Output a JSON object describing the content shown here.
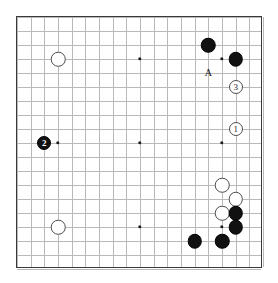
{
  "diagram": {
    "type": "go-board-diagram",
    "board_size": 19,
    "visible_region": {
      "columns": 19,
      "rows": 19,
      "note": "full board frame shown"
    },
    "colors": {
      "black_stone": "#111111",
      "white_stone": "#ffffff",
      "stone_outline": "#4d4d4d",
      "grid_line": "#b9b9b9",
      "border": "#3a3a3a",
      "background": "#ffffff",
      "label_text": "#111111"
    },
    "geometry": {
      "origin_x": 16,
      "origin_y": 16,
      "spacing_x": 13.67,
      "spacing_y": 14.0,
      "stone_diameter": 14.5,
      "numbered_stone_diameter": 14.0,
      "star_diameter": 3.4
    },
    "star_points": [
      {
        "col": 3,
        "row": 3
      },
      {
        "col": 9,
        "row": 3
      },
      {
        "col": 15,
        "row": 3
      },
      {
        "col": 3,
        "row": 9
      },
      {
        "col": 9,
        "row": 9
      },
      {
        "col": 15,
        "row": 9
      },
      {
        "col": 3,
        "row": 15
      },
      {
        "col": 9,
        "row": 15
      },
      {
        "col": 15,
        "row": 15
      }
    ],
    "stones": [
      {
        "id": "white-upper-left-hoshi",
        "color": "white",
        "col": 3,
        "row": 3,
        "label": ""
      },
      {
        "id": "black-upper-right-a",
        "color": "black",
        "col": 14,
        "row": 2,
        "label": ""
      },
      {
        "id": "black-upper-right-b",
        "color": "black",
        "col": 16,
        "row": 3,
        "label": ""
      },
      {
        "id": "white-move-3",
        "color": "white",
        "col": 16,
        "row": 5,
        "label": "3"
      },
      {
        "id": "white-move-1",
        "color": "white",
        "col": 16,
        "row": 8,
        "label": "1"
      },
      {
        "id": "black-move-2",
        "color": "black",
        "col": 2,
        "row": 9,
        "label": "2"
      },
      {
        "id": "white-lower-left-hoshi",
        "color": "white",
        "col": 3,
        "row": 15,
        "label": ""
      },
      {
        "id": "white-right-lower-a",
        "color": "white",
        "col": 15,
        "row": 12,
        "label": ""
      },
      {
        "id": "white-right-lower-b",
        "color": "white",
        "col": 16,
        "row": 13,
        "label": ""
      },
      {
        "id": "white-right-lower-c",
        "color": "white",
        "col": 15,
        "row": 14,
        "label": ""
      },
      {
        "id": "black-right-lower-a",
        "color": "black",
        "col": 16,
        "row": 14,
        "label": ""
      },
      {
        "id": "black-right-lower-b",
        "color": "black",
        "col": 16,
        "row": 15,
        "label": ""
      },
      {
        "id": "black-bottom-a",
        "color": "black",
        "col": 13,
        "row": 16,
        "label": ""
      },
      {
        "id": "black-bottom-b",
        "color": "black",
        "col": 15,
        "row": 16,
        "label": ""
      }
    ],
    "point_labels": [
      {
        "id": "point-label-a",
        "text": "A",
        "col": 14,
        "row": 4
      }
    ]
  }
}
